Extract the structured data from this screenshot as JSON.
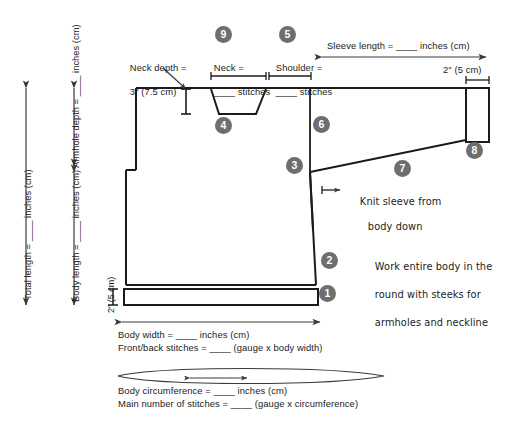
{
  "diagram": {
    "line_color": "#1b1b1b",
    "marker_color": "#6e6e6e",
    "marker_text_color": "#ffffff"
  },
  "labels": {
    "neck_depth": "Neck depth =\n3″ (7.5 cm)",
    "neck_depth_line1": "Neck depth =",
    "neck_depth_line2": "3″ (7.5 cm)",
    "neck_line1": "Neck =",
    "neck_line2": "____ stitches",
    "shoulder_line1": "Shoulder =",
    "shoulder_line2": "____ stitches",
    "sleeve_length": "Sleeve length = ____ inches (cm)",
    "cuff_width": "2″ (5 cm)",
    "hem_height": "2″ (5 cm)",
    "total_length": "Total length = ____ inches (cm)",
    "armhole_depth": "Armhole depth = ____ inches (cm)",
    "body_length": "Body length = ____ inches (cm)",
    "body_width": "Body width = ____ inches (cm)",
    "front_back_stitches": "Front/back stitches = ____ (gauge x body width)",
    "body_circumference": "Body circumference = ____ inches (cm)",
    "main_number_stitches": "Main number of stitches = ____ (gauge x circumference)",
    "knit_sleeve_line1": "Knit sleeve from",
    "knit_sleeve_line2": "body down",
    "steeks_line1": "Work entire body in the",
    "steeks_line2": "round with steeks for",
    "steeks_line3": "armholes and neckline"
  },
  "markers": [
    {
      "id": "marker-1",
      "number": "1",
      "meaning": "hem-band"
    },
    {
      "id": "marker-2",
      "number": "2",
      "meaning": "body-side-edge"
    },
    {
      "id": "marker-3",
      "number": "3",
      "meaning": "armhole-bottom"
    },
    {
      "id": "marker-4",
      "number": "4",
      "meaning": "neckline"
    },
    {
      "id": "marker-5",
      "number": "5",
      "meaning": "shoulder"
    },
    {
      "id": "marker-6",
      "number": "6",
      "meaning": "armhole-edge"
    },
    {
      "id": "marker-7",
      "number": "7",
      "meaning": "sleeve-underarm"
    },
    {
      "id": "marker-8",
      "number": "8",
      "meaning": "cuff"
    },
    {
      "id": "marker-9",
      "number": "9",
      "meaning": "neck-width"
    }
  ]
}
